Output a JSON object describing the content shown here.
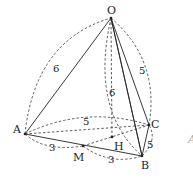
{
  "diagram": {
    "type": "tetrahedron",
    "points": {
      "O": {
        "label": "O",
        "x": 111,
        "y": 18
      },
      "A": {
        "label": "A",
        "x": 25,
        "y": 134
      },
      "B": {
        "label": "B",
        "x": 142,
        "y": 156
      },
      "C": {
        "label": "C",
        "x": 149,
        "y": 125
      },
      "M": {
        "label": "M",
        "x": 83,
        "y": 146
      },
      "H": {
        "label": "H",
        "x": 112,
        "y": 137
      }
    },
    "edge_lengths": {
      "OA": "6",
      "OB": "6",
      "OC": "5",
      "AC": "5",
      "AM": "3",
      "MB": "3",
      "BC": "5"
    },
    "cut_off_glyph": "A"
  }
}
